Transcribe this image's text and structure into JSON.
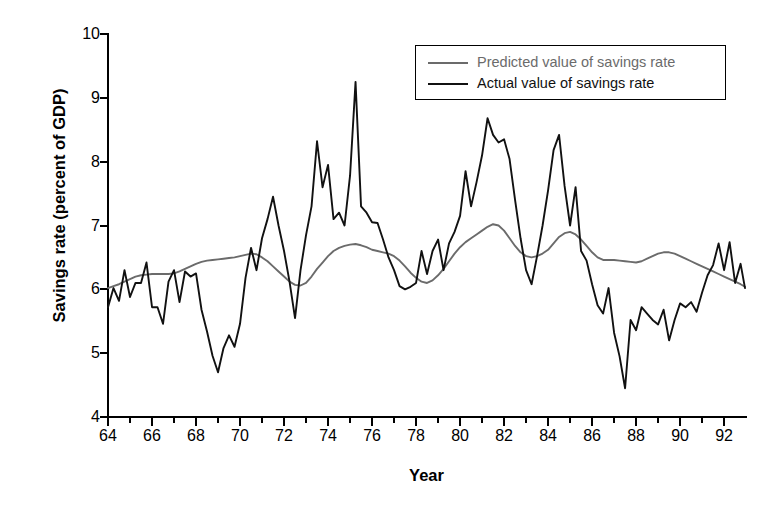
{
  "chart_data": {
    "type": "line",
    "title": "",
    "xlabel": "Year",
    "ylabel": "Savings rate (percent of GDP)",
    "xlim": [
      1964.0,
      1992.95
    ],
    "ylim": [
      4,
      10
    ],
    "grid": false,
    "legend_position": "top-right",
    "x_tick_labels": [
      "64",
      "66",
      "68",
      "70",
      "72",
      "74",
      "76",
      "78",
      "80",
      "82",
      "84",
      "86",
      "88",
      "90",
      "92"
    ],
    "x_tick_values": [
      1964,
      1966,
      1968,
      1970,
      1972,
      1974,
      1976,
      1978,
      1980,
      1982,
      1984,
      1986,
      1988,
      1990,
      1992
    ],
    "x_minor_tick_step": 1,
    "y_tick_labels": [
      "10",
      "9",
      "8",
      "7",
      "6",
      "5",
      "4"
    ],
    "y_tick_values": [
      10,
      9,
      8,
      7,
      6,
      5,
      4
    ],
    "colors": {
      "predicted": "#6b6b6b",
      "actual": "#111111",
      "axis": "#000000",
      "background": "#ffffff"
    },
    "series": [
      {
        "name": "Predicted value of savings rate",
        "color": "#6b6b6b",
        "x": [
          1964.0,
          1964.25,
          1964.5,
          1964.75,
          1965.0,
          1965.25,
          1965.5,
          1965.75,
          1966.0,
          1966.25,
          1966.5,
          1966.75,
          1967.0,
          1967.25,
          1967.5,
          1967.75,
          1968.0,
          1968.25,
          1968.5,
          1968.75,
          1969.0,
          1969.25,
          1969.5,
          1969.75,
          1970.0,
          1970.25,
          1970.5,
          1970.75,
          1971.0,
          1971.25,
          1971.5,
          1971.75,
          1972.0,
          1972.25,
          1972.5,
          1972.75,
          1973.0,
          1973.25,
          1973.5,
          1973.75,
          1974.0,
          1974.25,
          1974.5,
          1974.75,
          1975.0,
          1975.25,
          1975.5,
          1975.75,
          1976.0,
          1976.25,
          1976.5,
          1976.75,
          1977.0,
          1977.25,
          1977.5,
          1977.75,
          1978.0,
          1978.25,
          1978.5,
          1978.75,
          1979.0,
          1979.25,
          1979.5,
          1979.75,
          1980.0,
          1980.25,
          1980.5,
          1980.75,
          1981.0,
          1981.25,
          1981.5,
          1981.75,
          1982.0,
          1982.25,
          1982.5,
          1982.75,
          1983.0,
          1983.25,
          1983.5,
          1983.75,
          1984.0,
          1984.25,
          1984.5,
          1984.75,
          1985.0,
          1985.25,
          1985.5,
          1985.75,
          1986.0,
          1986.25,
          1986.5,
          1986.75,
          1987.0,
          1987.25,
          1987.5,
          1987.75,
          1988.0,
          1988.25,
          1988.5,
          1988.75,
          1989.0,
          1989.25,
          1989.5,
          1989.75,
          1990.0,
          1990.25,
          1990.5,
          1990.75,
          1991.0,
          1991.25,
          1991.5,
          1991.75,
          1992.0,
          1992.25,
          1992.5,
          1992.75,
          1992.95
        ],
        "values": [
          6.02,
          6.05,
          6.08,
          6.12,
          6.16,
          6.2,
          6.22,
          6.23,
          6.24,
          6.24,
          6.24,
          6.24,
          6.25,
          6.28,
          6.32,
          6.36,
          6.4,
          6.43,
          6.45,
          6.46,
          6.47,
          6.48,
          6.49,
          6.5,
          6.52,
          6.54,
          6.56,
          6.55,
          6.5,
          6.44,
          6.36,
          6.28,
          6.2,
          6.12,
          6.07,
          6.06,
          6.1,
          6.2,
          6.32,
          6.42,
          6.52,
          6.6,
          6.65,
          6.68,
          6.7,
          6.71,
          6.69,
          6.66,
          6.62,
          6.6,
          6.58,
          6.56,
          6.52,
          6.45,
          6.36,
          6.26,
          6.18,
          6.12,
          6.1,
          6.14,
          6.22,
          6.32,
          6.44,
          6.56,
          6.66,
          6.74,
          6.8,
          6.86,
          6.92,
          6.98,
          7.02,
          7.0,
          6.92,
          6.8,
          6.68,
          6.58,
          6.52,
          6.5,
          6.52,
          6.56,
          6.62,
          6.72,
          6.82,
          6.88,
          6.9,
          6.86,
          6.78,
          6.68,
          6.58,
          6.5,
          6.46,
          6.46,
          6.46,
          6.45,
          6.44,
          6.43,
          6.42,
          6.44,
          6.48,
          6.52,
          6.56,
          6.58,
          6.58,
          6.56,
          6.52,
          6.48,
          6.44,
          6.4,
          6.36,
          6.32,
          6.28,
          6.24,
          6.2,
          6.16,
          6.12,
          6.08,
          6.04
        ]
      },
      {
        "name": "Actual value of savings rate",
        "color": "#111111",
        "x": [
          1964.0,
          1964.25,
          1964.5,
          1964.75,
          1965.0,
          1965.25,
          1965.5,
          1965.75,
          1966.0,
          1966.25,
          1966.5,
          1966.75,
          1967.0,
          1967.25,
          1967.5,
          1967.75,
          1968.0,
          1968.25,
          1968.5,
          1968.75,
          1969.0,
          1969.25,
          1969.5,
          1969.75,
          1970.0,
          1970.25,
          1970.5,
          1970.75,
          1971.0,
          1971.25,
          1971.5,
          1971.75,
          1972.0,
          1972.25,
          1972.5,
          1972.75,
          1973.0,
          1973.25,
          1973.5,
          1973.75,
          1974.0,
          1974.25,
          1974.5,
          1974.75,
          1975.0,
          1975.25,
          1975.5,
          1975.75,
          1976.0,
          1976.25,
          1976.5,
          1976.75,
          1977.0,
          1977.25,
          1977.5,
          1977.75,
          1978.0,
          1978.25,
          1978.5,
          1978.75,
          1979.0,
          1979.25,
          1979.5,
          1979.75,
          1980.0,
          1980.25,
          1980.5,
          1980.75,
          1981.0,
          1981.25,
          1981.5,
          1981.75,
          1982.0,
          1982.25,
          1982.5,
          1982.75,
          1983.0,
          1983.25,
          1983.5,
          1983.75,
          1984.0,
          1984.25,
          1984.5,
          1984.75,
          1985.0,
          1985.25,
          1985.5,
          1985.75,
          1986.0,
          1986.25,
          1986.5,
          1986.75,
          1987.0,
          1987.25,
          1987.5,
          1987.75,
          1988.0,
          1988.25,
          1988.5,
          1988.75,
          1989.0,
          1989.25,
          1989.5,
          1989.75,
          1990.0,
          1990.25,
          1990.5,
          1990.75,
          1991.0,
          1991.25,
          1991.5,
          1991.75,
          1992.0,
          1992.25,
          1992.5,
          1992.75,
          1992.95
        ],
        "values": [
          5.72,
          6.02,
          5.82,
          6.3,
          5.88,
          6.1,
          6.1,
          6.42,
          5.72,
          5.72,
          5.46,
          6.12,
          6.3,
          5.8,
          6.28,
          6.2,
          6.25,
          5.68,
          5.34,
          4.96,
          4.7,
          5.08,
          5.28,
          5.1,
          5.46,
          6.18,
          6.65,
          6.3,
          6.8,
          7.1,
          7.45,
          7.0,
          6.6,
          6.12,
          5.55,
          6.3,
          6.85,
          7.3,
          8.32,
          7.6,
          7.95,
          7.1,
          7.2,
          7.0,
          7.78,
          9.25,
          7.3,
          7.2,
          7.05,
          7.04,
          6.78,
          6.5,
          6.3,
          6.05,
          6.0,
          6.04,
          6.1,
          6.6,
          6.24,
          6.6,
          6.78,
          6.3,
          6.72,
          6.9,
          7.15,
          7.85,
          7.3,
          7.68,
          8.1,
          8.68,
          8.42,
          8.3,
          8.35,
          8.04,
          7.4,
          6.8,
          6.3,
          6.08,
          6.52,
          7.0,
          7.55,
          8.18,
          8.42,
          7.62,
          7.0,
          7.6,
          6.6,
          6.45,
          6.08,
          5.75,
          5.62,
          6.02,
          5.32,
          4.95,
          4.45,
          5.52,
          5.36,
          5.72,
          5.62,
          5.52,
          5.45,
          5.68,
          5.2,
          5.52,
          5.78,
          5.72,
          5.8,
          5.65,
          5.95,
          6.22,
          6.38,
          6.72,
          6.3,
          6.74,
          6.1,
          6.4,
          6.02
        ]
      }
    ]
  },
  "legend": {
    "items": [
      {
        "label": "Predicted value of savings rate",
        "color": "#6b6b6b"
      },
      {
        "label": "Actual value of savings rate",
        "color": "#111111"
      }
    ]
  },
  "axes": {
    "x_title": "Year",
    "y_title": "Savings rate (percent of GDP)"
  }
}
